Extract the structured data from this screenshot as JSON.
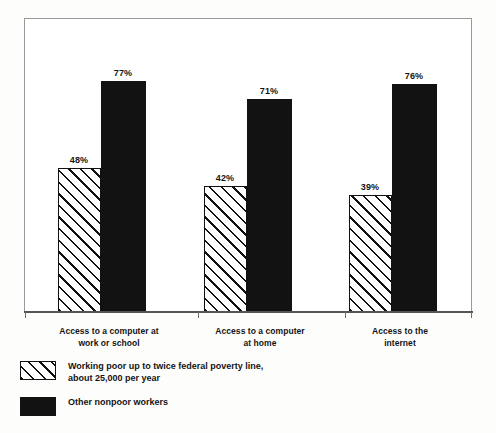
{
  "chart_data": {
    "type": "bar",
    "title": "",
    "subtitle": "",
    "xlabel": "",
    "ylabel": "",
    "ylim": [
      0,
      100
    ],
    "grid": false,
    "legend_position": "bottom-left",
    "value_suffix": "%",
    "categories": [
      "Access to a computer at work or school",
      "Access to a computer at home",
      "Access to the internet"
    ],
    "category_lines": [
      [
        "Access to a computer at",
        "work or school"
      ],
      [
        "Access to a computer",
        "at home"
      ],
      [
        "Access to the",
        "internet"
      ]
    ],
    "series": [
      {
        "name": "Working poor up to twice federal poverty line, about 25,000 per year",
        "legend_lines": [
          "Working poor up to twice federal poverty line,",
          "about 25,000 per year"
        ],
        "fill": "hatch",
        "color": "#111111",
        "values": [
          48,
          42,
          39
        ],
        "labels": [
          "48%",
          "42%",
          "39%"
        ]
      },
      {
        "name": "Other nonpoor workers",
        "legend_lines": [
          "Other nonpoor workers"
        ],
        "fill": "solid",
        "color": "#121212",
        "values": [
          77,
          71,
          76
        ],
        "labels": [
          "77%",
          "71%",
          "76%"
        ]
      }
    ]
  },
  "colors": {
    "page_background": "#fdfdfc",
    "plot_background": "#ffffff",
    "frame_border": "#9a9a9a",
    "axis": "#555555",
    "solid_bar": "#121212",
    "hatch_line": "#111111",
    "text": "#141414"
  }
}
